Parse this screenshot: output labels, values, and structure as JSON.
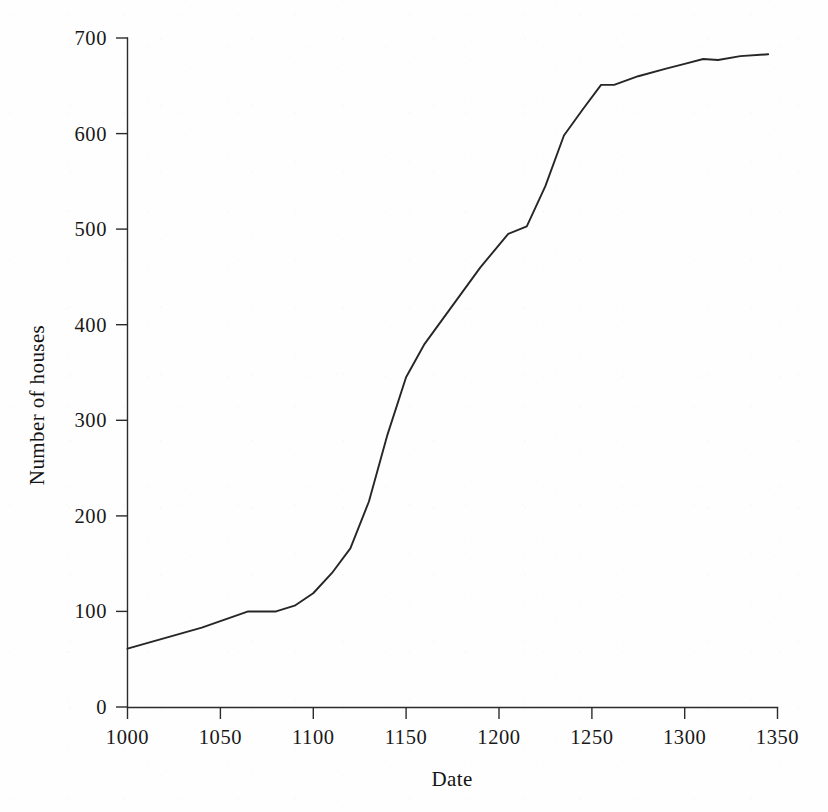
{
  "chart_data": {
    "type": "line",
    "title": "",
    "xlabel": "Date",
    "ylabel": "Number of houses",
    "xlim": [
      1000,
      1350
    ],
    "ylim": [
      0,
      700
    ],
    "grid": false,
    "legend": null,
    "x_ticks": [
      1000,
      1050,
      1100,
      1150,
      1200,
      1250,
      1300,
      1350
    ],
    "x_tick_labels": [
      "1000",
      "1050",
      "1100",
      "1150",
      "1200",
      "1250",
      "1300",
      "1350"
    ],
    "y_ticks": [
      0,
      100,
      200,
      300,
      400,
      500,
      600,
      700
    ],
    "y_tick_labels": [
      "0",
      "100",
      "200",
      "300",
      "400",
      "500",
      "600",
      "700"
    ],
    "series": [
      {
        "name": "Number of houses",
        "color": "#262626",
        "x": [
          1000,
          1020,
          1040,
          1065,
          1080,
          1090,
          1100,
          1110,
          1120,
          1130,
          1140,
          1150,
          1160,
          1175,
          1190,
          1205,
          1215,
          1225,
          1235,
          1245,
          1255,
          1262,
          1275,
          1290,
          1300,
          1310,
          1318,
          1330,
          1345
        ],
        "y": [
          61,
          72,
          83,
          100,
          100,
          106,
          119,
          140,
          166,
          215,
          285,
          345,
          380,
          420,
          460,
          495,
          503,
          545,
          598,
          625,
          651,
          651,
          660,
          668,
          673,
          678,
          677,
          681,
          683
        ],
        "values": [
          61,
          72,
          83,
          100,
          100,
          106,
          119,
          140,
          166,
          215,
          285,
          345,
          380,
          420,
          460,
          495,
          503,
          545,
          598,
          625,
          651,
          651,
          660,
          668,
          673,
          678,
          677,
          681,
          683
        ]
      }
    ]
  },
  "axes": {
    "x_axis_name": "Date",
    "y_axis_name": "Number of houses"
  }
}
